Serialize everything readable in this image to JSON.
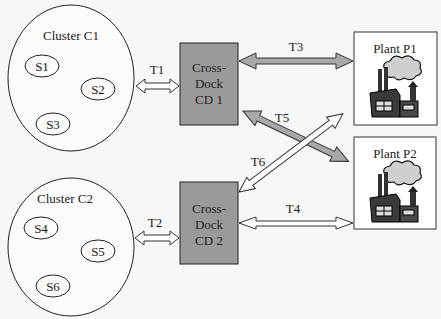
{
  "clusters": [
    {
      "id": "C1",
      "label": "Cluster C1",
      "suppliers": [
        "S1",
        "S2",
        "S3"
      ]
    },
    {
      "id": "C2",
      "label": "Cluster C2",
      "suppliers": [
        "S4",
        "S5",
        "S6"
      ]
    }
  ],
  "cross_docks": [
    {
      "id": "CD1",
      "line1": "Cross-",
      "line2": "Dock",
      "line3": "CD 1"
    },
    {
      "id": "CD2",
      "line1": "Cross-",
      "line2": "Dock",
      "line3": "CD 2"
    }
  ],
  "plants": [
    {
      "id": "P1",
      "label": "Plant P1",
      "icon": "factory-icon"
    },
    {
      "id": "P2",
      "label": "Plant P2",
      "icon": "factory-icon"
    }
  ],
  "transports": {
    "t1": "T1",
    "t2": "T2",
    "t3": "T3",
    "t4": "T4",
    "t5": "T5",
    "t6": "T6"
  },
  "colors": {
    "crossdock_fill": "#9a9a9a",
    "gray_arrow": "#a8a8a8",
    "white_arrow": "#ffffff",
    "stroke": "#333333"
  }
}
